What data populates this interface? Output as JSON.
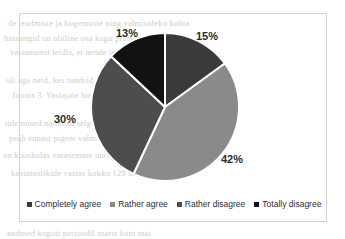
{
  "chart_data": {
    "type": "pie",
    "title": "",
    "categories": [
      "Completely agree",
      "Rather agree",
      "Rather disagree",
      "Totally disagree"
    ],
    "values": [
      15,
      42,
      30,
      13
    ],
    "value_labels": [
      "15%",
      "42%",
      "30%",
      "13%"
    ],
    "unit": "%",
    "colors": [
      "#3a3a3a",
      "#8a8a8a",
      "#4d4d4d",
      "#121212"
    ],
    "slice_separator_color": "#ffffff",
    "start_angle_deg": 0,
    "direction": "clockwise",
    "legend": {
      "position": "bottom",
      "orientation": "horizontal",
      "entries": [
        {
          "label": "Completely agree",
          "color": "#3a3a3a",
          "marker": "square-marker"
        },
        {
          "label": "Rather agree",
          "color": "#8a8a8a",
          "marker": "square-marker"
        },
        {
          "label": "Rather disagree",
          "color": "#4d4d4d",
          "marker": "square-marker"
        },
        {
          "label": "Totally disagree",
          "color": "#121212",
          "marker": "square-marker"
        }
      ]
    },
    "labels": {
      "completely_agree": "15%",
      "rather_agree": "42%",
      "rather_disagree": "30%",
      "totally_disagree": "13%"
    },
    "grid": false,
    "border_color": "#d4d4d4",
    "background": "#ffffff"
  },
  "background_text": {
    "lines": [
      "de teadmiste ja kogemuste ning valmisoleku kohta",
      "hinnangul on oluline osa kogu protsessis",
      "vastanutest leidis, et nende teadmised on piisavad",
      "oli aga neid, kes tundsid end ebakindlalt uues",
      "Joonis 3. Vastajate hinnang oma valmisolekule",
      "tulemused naitavad selgelt, et enamik vastajaid",
      "peab ennast pigem valmis olevaks ning see",
      "on kooskolas varasemate uuringute tulemustega",
      "kusimustikule vastas kokku 128 inimest",
      "andmed koguti perioodil marts kuni mai"
    ]
  }
}
